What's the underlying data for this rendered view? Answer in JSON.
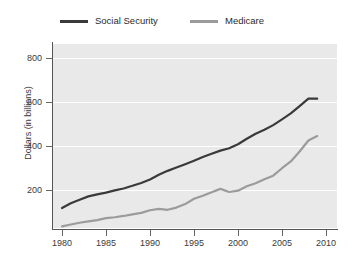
{
  "chart_data": {
    "type": "line",
    "title": "",
    "subtitle": "",
    "xlabel": "",
    "ylabel": "Dollars (in billions)",
    "xlim": [
      1980,
      2010
    ],
    "ylim": [
      0,
      900
    ],
    "xticks": [
      1980,
      1985,
      1990,
      1995,
      2000,
      2005,
      2010
    ],
    "xtick_labels": [
      "1980",
      "1985",
      "1990",
      "1995",
      "2000",
      "2005",
      "2010"
    ],
    "yticks": [
      200,
      400,
      600,
      800
    ],
    "ytick_labels": [
      "200",
      "400",
      "600",
      "800"
    ],
    "grid": "horizontal-white",
    "legend_position": "top",
    "x": [
      1980,
      1981,
      1982,
      1983,
      1984,
      1985,
      1986,
      1987,
      1988,
      1989,
      1990,
      1991,
      1992,
      1993,
      1994,
      1995,
      1996,
      1997,
      1998,
      1999,
      2000,
      2001,
      2002,
      2003,
      2004,
      2005,
      2006,
      2007,
      2008,
      2009
    ],
    "series": [
      {
        "name": "Social Security",
        "color": "#3a3a3a",
        "values": [
          118,
          140,
          156,
          171,
          180,
          188,
          198,
          207,
          219,
          232,
          248,
          269,
          287,
          302,
          317,
          333,
          350,
          365,
          379,
          390,
          408,
          433,
          456,
          474,
          495,
          521,
          548,
          581,
          615,
          615
        ]
      },
      {
        "name": "Medicare",
        "color": "#9b9b9b",
        "values": [
          35,
          43,
          51,
          57,
          63,
          72,
          76,
          82,
          89,
          96,
          108,
          114,
          110,
          120,
          136,
          160,
          174,
          190,
          205,
          191,
          197,
          217,
          231,
          249,
          265,
          299,
          330,
          375,
          425,
          445
        ]
      }
    ]
  },
  "legend": {
    "items": [
      {
        "label": "Social Security",
        "color": "#3a3a3a"
      },
      {
        "label": "Medicare",
        "color": "#9b9b9b"
      }
    ]
  },
  "axes": {
    "ylabel": "Dollars (in billions)",
    "ytick_labels": [
      "800",
      "600",
      "400",
      "200"
    ],
    "xtick_labels": [
      "1980",
      "1985",
      "1990",
      "1995",
      "2000",
      "2005",
      "2010"
    ]
  }
}
